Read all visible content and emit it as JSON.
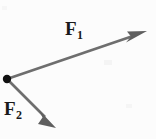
{
  "figure": {
    "background_color": "#fcfcfc",
    "width": 156,
    "height": 139
  },
  "origin": {
    "label": "common-origin-point",
    "x": 7,
    "y": 79,
    "radius": 4,
    "color": "#111111"
  },
  "vectors": [
    {
      "id": "F1",
      "label_symbol": "F",
      "label_subscript": "1",
      "color": "#6e6e6e",
      "start_x": 7,
      "start_y": 79,
      "end_x": 146,
      "end_y": 32,
      "shaft_width": 2.6,
      "head_length": 17,
      "head_width": 9,
      "direction": "up-and-to-the-right"
    },
    {
      "id": "F2",
      "label_symbol": "F",
      "label_subscript": "2",
      "color": "#6e6e6e",
      "start_x": 7,
      "start_y": 79,
      "end_x": 56,
      "end_y": 128,
      "shaft_width": 2.6,
      "head_length": 16,
      "head_width": 9,
      "direction": "down-and-to-the-right"
    }
  ],
  "labels": {
    "f1": {
      "symbol": "F",
      "subscript": "1"
    },
    "f2": {
      "symbol": "F",
      "subscript": "2"
    }
  }
}
